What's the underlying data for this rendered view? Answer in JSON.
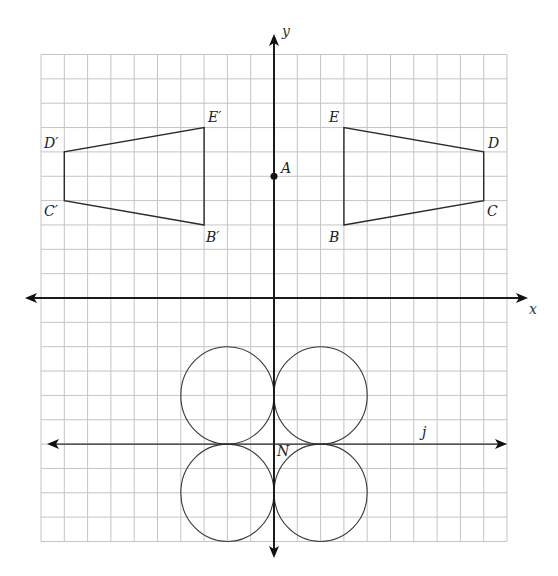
{
  "grid": {
    "x_min": -10,
    "x_max": 10,
    "y_min": -10,
    "y_max": 10,
    "origin_px": [
      274,
      298
    ],
    "cell_w": 23.3,
    "cell_h": 24.35,
    "line_color": "#c4c4c4"
  },
  "axes": {
    "x_label": "x",
    "y_label": "y"
  },
  "point_A": {
    "label": "A",
    "x": 0,
    "y": 5
  },
  "polygon_original": {
    "vertices": [
      {
        "label": "B",
        "x": 3,
        "y": 3
      },
      {
        "label": "C",
        "x": 9,
        "y": 4
      },
      {
        "label": "D",
        "x": 9,
        "y": 6
      },
      {
        "label": "E",
        "x": 3,
        "y": 7
      }
    ]
  },
  "polygon_image": {
    "vertices": [
      {
        "label": "B′",
        "x": -3,
        "y": 3
      },
      {
        "label": "C′",
        "x": -9,
        "y": 4
      },
      {
        "label": "D′",
        "x": -9,
        "y": 6
      },
      {
        "label": "E′",
        "x": -3,
        "y": 7
      }
    ]
  },
  "line_j": {
    "label": "j",
    "y": -6,
    "label_x": 6.4
  },
  "point_N": {
    "label": "N",
    "x": 0,
    "y": -6
  },
  "circles": [
    {
      "cx": -2,
      "cy": -4,
      "r": 2
    },
    {
      "cx": 2,
      "cy": -4,
      "r": 2
    },
    {
      "cx": -2,
      "cy": -8,
      "r": 2
    },
    {
      "cx": 2,
      "cy": -8,
      "r": 2
    }
  ]
}
